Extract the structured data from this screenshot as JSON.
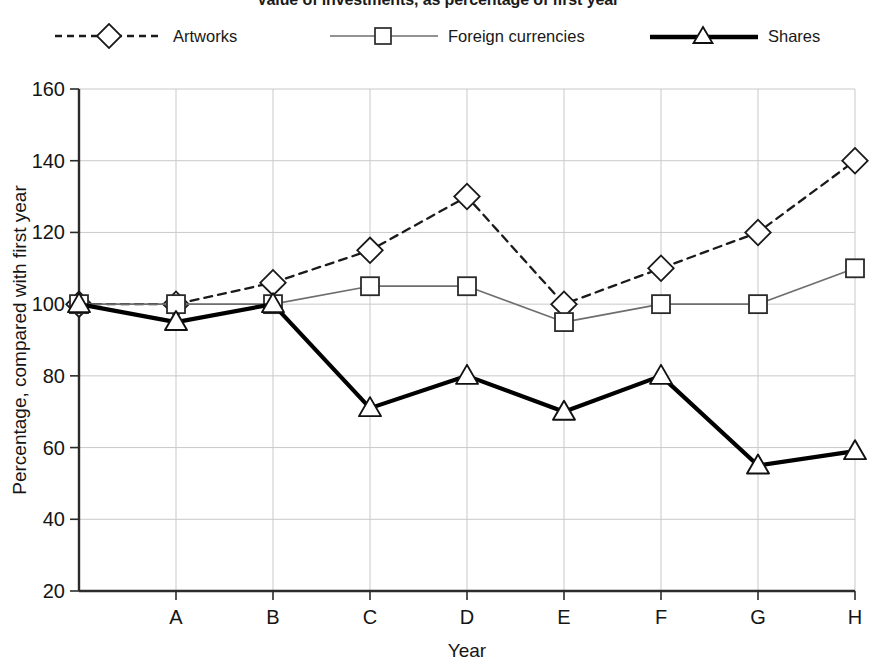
{
  "title": "Value of investments, as percentage of first year",
  "legend": {
    "position": "top",
    "items": [
      {
        "label": "Artworks",
        "marker": "diamond-marker",
        "line": "dashed",
        "color": "#1a1a1a",
        "width": 2.2
      },
      {
        "label": "Foreign currencies",
        "marker": "square-marker",
        "line": "solid",
        "color": "#6e6e6e",
        "width": 1.6
      },
      {
        "label": "Shares",
        "marker": "triangle-marker",
        "line": "solid",
        "color": "#000000",
        "width": 4.2
      }
    ]
  },
  "axes": {
    "x": {
      "label": "Year",
      "ticks": [
        "",
        "A",
        "B",
        "C",
        "D",
        "E",
        "F",
        "G",
        "H"
      ]
    },
    "y": {
      "label": "Percentage, compared with first year",
      "ticks": [
        160,
        140,
        120,
        100,
        80,
        60,
        40,
        20
      ],
      "min": 20,
      "max": 160
    }
  },
  "chart_data": {
    "type": "line",
    "title": "Value of investments, as percentage of first year",
    "xlabel": "Year",
    "ylabel": "Percentage, compared with first year",
    "categories": [
      "",
      "A",
      "B",
      "C",
      "D",
      "E",
      "F",
      "G",
      "H"
    ],
    "x_tick_labels": [
      "",
      "A",
      "B",
      "C",
      "D",
      "E",
      "F",
      "G",
      "H"
    ],
    "y_tick_labels": [
      "20",
      "40",
      "60",
      "80",
      "100",
      "120",
      "140",
      "160"
    ],
    "ylim": [
      20,
      160
    ],
    "ystep": 20,
    "grid": true,
    "legend_position": "top",
    "series": [
      {
        "name": "Artworks",
        "marker": "diamond",
        "linestyle": "dashed",
        "color": "#1a1a1a",
        "values": [
          100,
          100,
          106,
          115,
          130,
          100,
          110,
          120,
          140
        ]
      },
      {
        "name": "Foreign currencies",
        "marker": "square",
        "linestyle": "solid",
        "color": "#6e6e6e",
        "values": [
          100,
          100,
          100,
          105,
          105,
          95,
          100,
          100,
          110
        ]
      },
      {
        "name": "Shares",
        "marker": "triangle",
        "linestyle": "solid",
        "color": "#000000",
        "values": [
          100,
          95,
          100,
          71,
          80,
          70,
          80,
          55,
          59
        ]
      }
    ]
  }
}
